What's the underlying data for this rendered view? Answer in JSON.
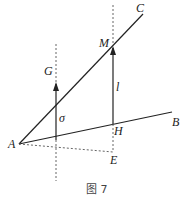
{
  "figure": {
    "caption": "图 7",
    "labels": {
      "A": "A",
      "B": "B",
      "C": "C",
      "M": "M",
      "G": "G",
      "H": "H",
      "E": "E",
      "l": "l",
      "sigma": "σ"
    },
    "colors": {
      "line": "#222222",
      "dashed": "#555555",
      "caption": "#444444"
    }
  }
}
